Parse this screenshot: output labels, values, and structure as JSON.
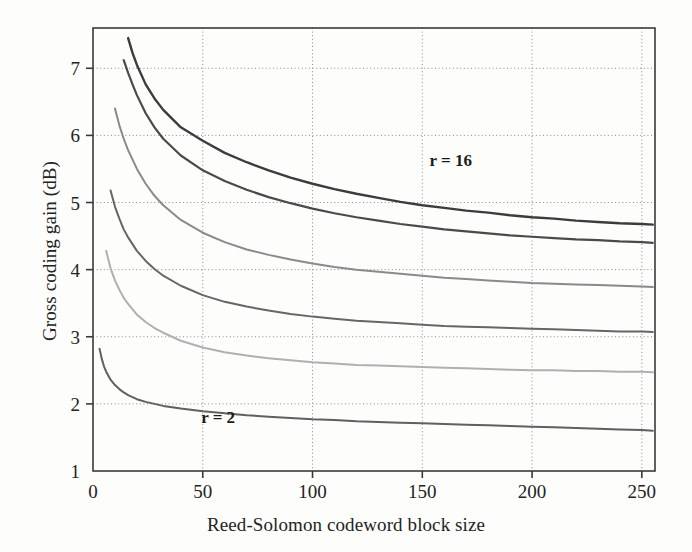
{
  "chart_data": {
    "type": "line",
    "title": "",
    "xlabel": "Reed-Solomon codeword block size",
    "ylabel": "Gross coding gain (dB)",
    "xlim": [
      0,
      256
    ],
    "ylim": [
      1,
      7.6
    ],
    "xticks": [
      0,
      50,
      100,
      150,
      200,
      250
    ],
    "xtick_labels": [
      "0",
      "50",
      "100",
      "150",
      "200",
      "250"
    ],
    "yticks": [
      1,
      2,
      3,
      4,
      5,
      6,
      7
    ],
    "ytick_labels": [
      "1",
      "2",
      "3",
      "4",
      "5",
      "6",
      "7"
    ],
    "grid": true,
    "grid_style": "dotted",
    "legend": "none",
    "annotations": [
      {
        "text": "r = 16",
        "x": 163,
        "y": 5.55
      },
      {
        "text": "r = 2",
        "x": 57,
        "y": 1.72
      }
    ],
    "series": [
      {
        "name": "r = 16",
        "color": "#3c3c3c",
        "width": 2.4,
        "x": [
          16,
          18,
          20,
          24,
          28,
          32,
          40,
          50,
          60,
          70,
          80,
          90,
          100,
          110,
          120,
          130,
          140,
          150,
          160,
          170,
          180,
          190,
          200,
          210,
          220,
          230,
          240,
          250,
          255
        ],
        "y": [
          7.45,
          7.23,
          7.05,
          6.76,
          6.55,
          6.38,
          6.12,
          5.92,
          5.74,
          5.6,
          5.48,
          5.37,
          5.28,
          5.2,
          5.13,
          5.07,
          5.01,
          4.96,
          4.92,
          4.88,
          4.85,
          4.81,
          4.78,
          4.76,
          4.73,
          4.71,
          4.69,
          4.68,
          4.67
        ]
      },
      {
        "name": "r = 12",
        "color": "#4a4a4a",
        "width": 2.2,
        "x": [
          14,
          16,
          18,
          20,
          24,
          28,
          32,
          40,
          50,
          60,
          70,
          80,
          90,
          100,
          110,
          120,
          130,
          140,
          150,
          160,
          170,
          180,
          190,
          200,
          210,
          220,
          230,
          240,
          250,
          255
        ],
        "y": [
          7.12,
          6.93,
          6.76,
          6.6,
          6.33,
          6.12,
          5.95,
          5.7,
          5.48,
          5.32,
          5.19,
          5.08,
          4.99,
          4.91,
          4.84,
          4.78,
          4.73,
          4.68,
          4.64,
          4.6,
          4.57,
          4.54,
          4.51,
          4.49,
          4.47,
          4.45,
          4.44,
          4.42,
          4.41,
          4.4
        ]
      },
      {
        "name": "r = 8",
        "color": "#8a8a8a",
        "width": 2.0,
        "x": [
          10,
          12,
          14,
          16,
          20,
          24,
          28,
          32,
          40,
          50,
          60,
          70,
          80,
          90,
          100,
          110,
          120,
          130,
          140,
          150,
          160,
          170,
          180,
          190,
          200,
          210,
          220,
          230,
          240,
          250,
          255
        ],
        "y": [
          6.4,
          6.15,
          5.95,
          5.78,
          5.5,
          5.28,
          5.1,
          4.96,
          4.74,
          4.55,
          4.41,
          4.3,
          4.22,
          4.15,
          4.09,
          4.04,
          4.0,
          3.97,
          3.94,
          3.91,
          3.88,
          3.86,
          3.84,
          3.82,
          3.8,
          3.79,
          3.78,
          3.77,
          3.76,
          3.75,
          3.74
        ]
      },
      {
        "name": "r = 6",
        "color": "#666666",
        "width": 2.0,
        "x": [
          8,
          10,
          12,
          14,
          16,
          20,
          24,
          28,
          32,
          40,
          50,
          60,
          70,
          80,
          90,
          100,
          110,
          120,
          130,
          140,
          150,
          160,
          170,
          180,
          190,
          200,
          210,
          220,
          230,
          240,
          250,
          255
        ],
        "y": [
          5.18,
          4.94,
          4.76,
          4.6,
          4.48,
          4.28,
          4.13,
          4.01,
          3.91,
          3.76,
          3.62,
          3.52,
          3.45,
          3.39,
          3.34,
          3.3,
          3.27,
          3.24,
          3.22,
          3.2,
          3.18,
          3.16,
          3.15,
          3.14,
          3.13,
          3.12,
          3.11,
          3.1,
          3.09,
          3.08,
          3.08,
          3.07
        ]
      },
      {
        "name": "r = 4",
        "color": "#b0b0b0",
        "width": 2.0,
        "x": [
          6,
          8,
          10,
          12,
          14,
          16,
          20,
          24,
          28,
          32,
          40,
          50,
          60,
          70,
          80,
          90,
          100,
          110,
          120,
          130,
          140,
          150,
          160,
          170,
          180,
          190,
          200,
          210,
          220,
          230,
          240,
          250,
          255
        ],
        "y": [
          4.28,
          4.02,
          3.84,
          3.7,
          3.58,
          3.49,
          3.33,
          3.22,
          3.13,
          3.06,
          2.94,
          2.84,
          2.77,
          2.72,
          2.68,
          2.65,
          2.62,
          2.6,
          2.58,
          2.57,
          2.56,
          2.55,
          2.54,
          2.53,
          2.52,
          2.51,
          2.5,
          2.5,
          2.49,
          2.49,
          2.48,
          2.48,
          2.47
        ]
      },
      {
        "name": "r = 2",
        "color": "#606060",
        "width": 2.0,
        "x": [
          3,
          4,
          5,
          6,
          8,
          10,
          12,
          14,
          16,
          20,
          24,
          28,
          32,
          40,
          50,
          60,
          70,
          80,
          90,
          100,
          110,
          120,
          130,
          140,
          150,
          160,
          170,
          180,
          190,
          200,
          210,
          220,
          230,
          240,
          250,
          255
        ],
        "y": [
          2.82,
          2.67,
          2.56,
          2.48,
          2.36,
          2.28,
          2.22,
          2.17,
          2.13,
          2.07,
          2.03,
          2.0,
          1.97,
          1.93,
          1.89,
          1.86,
          1.83,
          1.81,
          1.79,
          1.77,
          1.76,
          1.74,
          1.73,
          1.72,
          1.71,
          1.7,
          1.69,
          1.68,
          1.67,
          1.66,
          1.65,
          1.64,
          1.63,
          1.62,
          1.61,
          1.6
        ]
      }
    ]
  },
  "axes": {
    "ylabel": "Gross coding gain (dB)",
    "xlabel": "Reed-Solomon codeword block size"
  }
}
